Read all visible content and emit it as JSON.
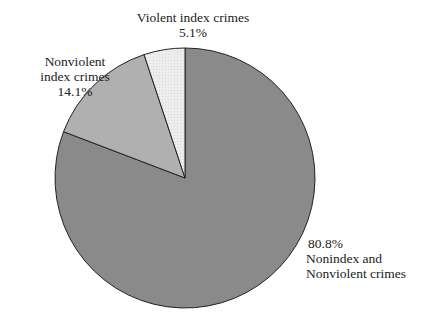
{
  "chart_data": {
    "type": "pie",
    "title": "",
    "categories": [
      "Noninindex and Nonviolent crimes",
      "Nonviolent index crimes",
      "Violent index crimes"
    ],
    "slices": [
      {
        "label": "Nonindex and Nonviolent crimes",
        "value": 80.8,
        "display": "80.8%",
        "color": "#8a8a8a"
      },
      {
        "label": "Nonviolent index crimes",
        "value": 14.1,
        "display": "14.1%",
        "color": "#b0b0b0"
      },
      {
        "label": "Violent index crimes",
        "value": 5.1,
        "display": "5.1%",
        "color": "#ececec"
      }
    ],
    "start_angle_deg": 0,
    "direction": "clockwise",
    "legend": "none"
  },
  "labels": {
    "violent_line1": "Violent index crimes",
    "violent_pct": "5.1%",
    "nonviolent_line1": "Nonviolent",
    "nonviolent_line2": "index crimes",
    "nonviolent_pct": "14.1%",
    "nonindex_pct": "80.8%",
    "nonindex_line1": "Nonindex and",
    "nonindex_line2": "Nonviolent crimes"
  }
}
